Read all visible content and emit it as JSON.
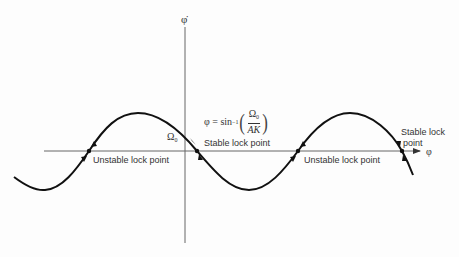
{
  "diagram": {
    "axes": {
      "y_label": "φ̇",
      "x_label": "φ",
      "origin_value_label": "Ω",
      "origin_value_subscript": "0"
    },
    "formula": {
      "lhs": "φ = sin",
      "exponent": "−1",
      "numerator": "Ω",
      "numerator_subscript": "0",
      "denominator": "AK"
    },
    "annotations": [
      {
        "id": "unstable-1",
        "text": "Unstable lock point"
      },
      {
        "id": "stable-1",
        "text": "Stable lock point"
      },
      {
        "id": "unstable-2",
        "text": "Unstable lock point"
      },
      {
        "id": "stable-2-line1",
        "text": "Stable lock"
      },
      {
        "id": "stable-2-line2",
        "text": "point"
      }
    ],
    "curve": {
      "type": "sinusoid",
      "description": "phase-locked loop dφ/dt vs φ, offset by Ω0",
      "color": "#111111",
      "axis_color": "#555555"
    }
  }
}
